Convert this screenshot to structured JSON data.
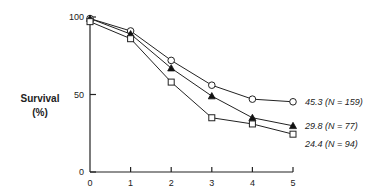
{
  "chart_data": {
    "type": "line",
    "title": "",
    "xlabel": "",
    "ylabel": "Survival (%)",
    "ylabel_lines": [
      "Survival",
      "(%)"
    ],
    "x": [
      0,
      1,
      2,
      3,
      4,
      5
    ],
    "xticks": [
      "0",
      "1",
      "2",
      "3",
      "4",
      "5"
    ],
    "yticks": [
      "0",
      "50",
      "100"
    ],
    "xlim": [
      0,
      5
    ],
    "ylim": [
      0,
      100
    ],
    "grid": false,
    "legend": "none (end-of-line annotations)",
    "series": [
      {
        "name": "45.3 (N = 159)",
        "marker": "open-circle",
        "values": [
          99,
          91,
          72,
          56,
          47,
          45.3
        ]
      },
      {
        "name": "29.8 (N = 77)",
        "marker": "filled-triangle",
        "values": [
          99,
          89,
          67,
          49,
          35,
          29.8
        ]
      },
      {
        "name": "24.4 (N = 94)",
        "marker": "open-square",
        "values": [
          97,
          86,
          58,
          35,
          31,
          24.4
        ]
      }
    ],
    "annotations": [
      "45.3 (N = 159)",
      "29.8 (N = 77)",
      "24.4 (N = 94)"
    ]
  }
}
